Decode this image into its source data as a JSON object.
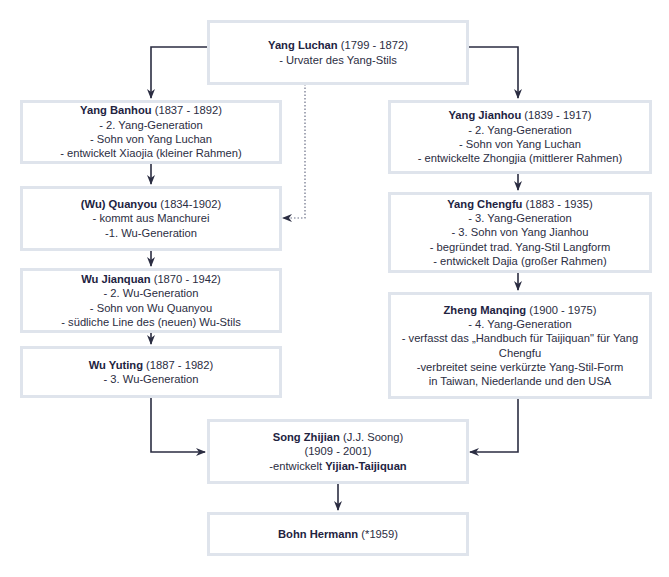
{
  "diagram": {
    "type": "lineage-tree",
    "colors": {
      "box_border": "#dfe4ec",
      "connector": "#2b2d42",
      "text": "#2b2d42"
    },
    "nodes": {
      "luchan": {
        "name": "Yang Luchan",
        "dates": "(1799 - 1872)",
        "lines": [
          "- Urvater des Yang-Stils"
        ]
      },
      "banhou": {
        "name": "Yang Banhou",
        "dates": "(1837 - 1892)",
        "lines": [
          "- 2. Yang-Generation",
          "- Sohn von Yang Luchan",
          "- entwickelt Xiaojia (kleiner Rahmen)"
        ]
      },
      "quanyou": {
        "name": "(Wu) Quanyou",
        "dates": "(1834-1902)",
        "lines": [
          "- kommt aus Manchurei",
          "-1. Wu-Generation"
        ]
      },
      "jianquan": {
        "name": "Wu Jianquan",
        "dates": "(1870 - 1942)",
        "lines": [
          "- 2. Wu-Generation",
          "- Sohn von Wu Quanyou",
          "- südliche Line des (neuen) Wu-Stils"
        ]
      },
      "yuting": {
        "name": "Wu Yuting",
        "dates": "(1887 - 1982)",
        "lines": [
          "- 3. Wu-Generation"
        ]
      },
      "jianhou": {
        "name": "Yang Jianhou",
        "dates": "(1839 - 1917)",
        "lines": [
          "- 2. Yang-Generation",
          "- Sohn von Yang Luchan",
          "- entwickelte Zhongjia (mittlerer Rahmen)"
        ]
      },
      "chengfu": {
        "name": "Yang Chengfu",
        "dates": "(1883 - 1935)",
        "lines": [
          "- 3. Yang-Generation",
          "- 3. Sohn von Yang Jianhou",
          "- begründet trad. Yang-Stil Langform",
          "- entwickelt Dajia (großer Rahmen)"
        ]
      },
      "zheng": {
        "name": "Zheng Manqing",
        "dates": "(1900 - 1975)",
        "lines": [
          "- 4. Yang-Generation",
          "- verfasst das „Handbuch für Taijiquan\" für Yang",
          "Chengfu",
          "-verbreitet seine verkürzte Yang-Stil-Form",
          "in Taiwan, Niederlande und den USA"
        ]
      },
      "song": {
        "name": "Song Zhijian",
        "alias": "(J.J. Soong)",
        "dates": "(1909 - 2001)",
        "develops_prefix": "-entwickelt",
        "develops_style": "Yijian-Taijiquan"
      },
      "bohn": {
        "name": "Bohn Hermann",
        "dates": "(*1959)"
      }
    },
    "edges": [
      {
        "from": "Yang Luchan",
        "to": "Yang Banhou",
        "style": "solid"
      },
      {
        "from": "Yang Luchan",
        "to": "Yang Jianhou",
        "style": "solid"
      },
      {
        "from": "Yang Luchan",
        "to": "(Wu) Quanyou",
        "style": "dotted"
      },
      {
        "from": "Yang Banhou",
        "to": "(Wu) Quanyou",
        "style": "solid"
      },
      {
        "from": "(Wu) Quanyou",
        "to": "Wu Jianquan",
        "style": "solid"
      },
      {
        "from": "Wu Jianquan",
        "to": "Wu Yuting",
        "style": "solid"
      },
      {
        "from": "Wu Yuting",
        "to": "Song Zhijian",
        "style": "solid"
      },
      {
        "from": "Yang Jianhou",
        "to": "Yang Chengfu",
        "style": "solid"
      },
      {
        "from": "Yang Chengfu",
        "to": "Zheng Manqing",
        "style": "solid"
      },
      {
        "from": "Zheng Manqing",
        "to": "Song Zhijian",
        "style": "solid"
      },
      {
        "from": "Song Zhijian",
        "to": "Bohn Hermann",
        "style": "solid"
      }
    ]
  }
}
